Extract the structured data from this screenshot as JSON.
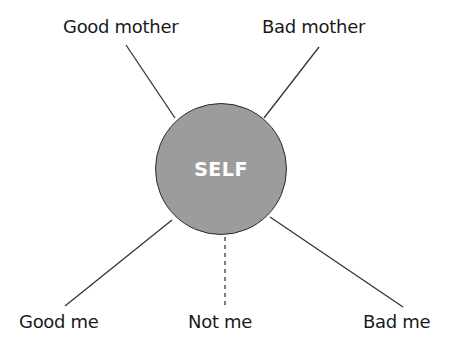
{
  "diagram": {
    "center": {
      "label": "SELF",
      "fill": "#9c9c9c",
      "text_color": "#ffffff"
    },
    "nodes": [
      {
        "id": "good-mother",
        "label": "Good mother",
        "connector": "solid"
      },
      {
        "id": "bad-mother",
        "label": "Bad mother",
        "connector": "solid"
      },
      {
        "id": "good-me",
        "label": "Good me",
        "connector": "solid"
      },
      {
        "id": "not-me",
        "label": "Not me",
        "connector": "dashed"
      },
      {
        "id": "bad-me",
        "label": "Bad me",
        "connector": "solid"
      }
    ],
    "line_color": "#333333"
  }
}
